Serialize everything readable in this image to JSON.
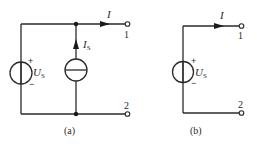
{
  "figure_a": {
    "caption": "(a)",
    "voltage_source": {
      "symbol": "U",
      "subscript": "S",
      "plus": "+",
      "minus": "−"
    },
    "current_source": {
      "symbol": "I",
      "subscript": "S"
    },
    "current_label": "I",
    "terminal_1": "1",
    "terminal_2": "2"
  },
  "figure_b": {
    "caption": "(b)",
    "voltage_source": {
      "symbol": "U",
      "subscript": "S",
      "plus": "+",
      "minus": "−"
    },
    "current_label": "I",
    "terminal_1": "1",
    "terminal_2": "2"
  },
  "colors": {
    "line": "#2a2a2a",
    "background": "#ffffff"
  }
}
